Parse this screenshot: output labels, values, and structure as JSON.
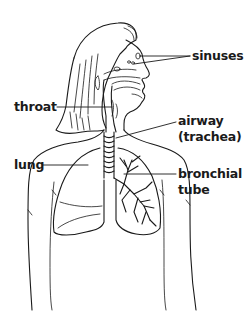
{
  "diagram": {
    "labels": {
      "sinuses": "sinuses",
      "throat": "throat",
      "airway_line1": "airway",
      "airway_line2": "(trachea)",
      "lung": "lung",
      "bronchial_line1": "bronchial",
      "bronchial_line2": "tube"
    },
    "colors": {
      "line": "#1a1a1a",
      "background": "#ffffff"
    }
  }
}
